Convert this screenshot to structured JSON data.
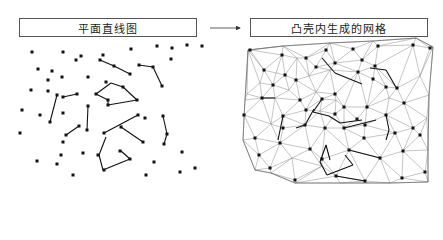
{
  "left_panel": {
    "title": "平面直线图",
    "points": [
      [
        32,
        52
      ],
      [
        63,
        52
      ],
      [
        76,
        60
      ],
      [
        81,
        56
      ],
      [
        103,
        55
      ],
      [
        131,
        49
      ],
      [
        157,
        46
      ],
      [
        187,
        45
      ],
      [
        202,
        46
      ],
      [
        100,
        60
      ],
      [
        114,
        66
      ],
      [
        130,
        74
      ],
      [
        139,
        65
      ],
      [
        153,
        67
      ],
      [
        162,
        86
      ],
      [
        171,
        59
      ],
      [
        172,
        48
      ],
      [
        38,
        69
      ],
      [
        52,
        71
      ],
      [
        62,
        77
      ],
      [
        48,
        80
      ],
      [
        88,
        77
      ],
      [
        63,
        97
      ],
      [
        77,
        94
      ],
      [
        31,
        90
      ],
      [
        48,
        91
      ],
      [
        57,
        95
      ],
      [
        106,
        82
      ],
      [
        123,
        87
      ],
      [
        96,
        94
      ],
      [
        108,
        100
      ],
      [
        108,
        105
      ],
      [
        137,
        100
      ],
      [
        22,
        110
      ],
      [
        40,
        115
      ],
      [
        63,
        113
      ],
      [
        88,
        106
      ],
      [
        138,
        115
      ],
      [
        145,
        118
      ],
      [
        163,
        116
      ],
      [
        50,
        122
      ],
      [
        79,
        126
      ],
      [
        66,
        135
      ],
      [
        87,
        130
      ],
      [
        20,
        133
      ],
      [
        104,
        133
      ],
      [
        121,
        127
      ],
      [
        143,
        142
      ],
      [
        167,
        134
      ],
      [
        164,
        144
      ],
      [
        63,
        142
      ],
      [
        83,
        153
      ],
      [
        61,
        155
      ],
      [
        98,
        155
      ],
      [
        120,
        151
      ],
      [
        130,
        159
      ],
      [
        37,
        161
      ],
      [
        57,
        164
      ],
      [
        73,
        175
      ],
      [
        104,
        170
      ],
      [
        154,
        162
      ],
      [
        146,
        175
      ],
      [
        182,
        152
      ],
      [
        195,
        168
      ],
      [
        180,
        172
      ]
    ],
    "segments": [
      [
        [
          100,
          60
        ],
        [
          114,
          66
        ]
      ],
      [
        [
          114,
          66
        ],
        [
          130,
          74
        ]
      ],
      [
        [
          139,
          65
        ],
        [
          153,
          67
        ]
      ],
      [
        [
          153,
          67
        ],
        [
          162,
          86
        ]
      ],
      [
        [
          63,
          97
        ],
        [
          77,
          94
        ]
      ],
      [
        [
          111,
          83
        ],
        [
          96,
          94
        ]
      ],
      [
        [
          111,
          83
        ],
        [
          123,
          87
        ]
      ],
      [
        [
          123,
          87
        ],
        [
          137,
          100
        ]
      ],
      [
        [
          96,
          94
        ],
        [
          108,
          100
        ]
      ],
      [
        [
          108,
          100
        ],
        [
          108,
          105
        ]
      ],
      [
        [
          108,
          105
        ],
        [
          137,
          100
        ]
      ],
      [
        [
          57,
          95
        ],
        [
          50,
          122
        ]
      ],
      [
        [
          88,
          106
        ],
        [
          87,
          130
        ]
      ],
      [
        [
          66,
          135
        ],
        [
          79,
          126
        ]
      ],
      [
        [
          104,
          133
        ],
        [
          138,
          115
        ]
      ],
      [
        [
          121,
          127
        ],
        [
          143,
          142
        ]
      ],
      [
        [
          163,
          116
        ],
        [
          167,
          134
        ]
      ],
      [
        [
          167,
          134
        ],
        [
          164,
          144
        ]
      ],
      [
        [
          106,
          137
        ],
        [
          99,
          155
        ]
      ],
      [
        [
          99,
          155
        ],
        [
          103,
          170
        ]
      ],
      [
        [
          103,
          170
        ],
        [
          130,
          159
        ]
      ],
      [
        [
          130,
          159
        ],
        [
          121,
          151
        ]
      ]
    ]
  },
  "arrow": {
    "x1": 210,
    "y1": 28,
    "x2": 240,
    "y2": 28
  },
  "right_panel": {
    "title": "凸壳内生成的网格",
    "hull": [
      [
        248,
        50
      ],
      [
        283,
        46
      ],
      [
        330,
        43
      ],
      [
        373,
        41
      ],
      [
        416,
        38
      ],
      [
        433,
        47
      ],
      [
        429,
        95
      ],
      [
        428,
        150
      ],
      [
        428,
        182
      ],
      [
        390,
        183
      ],
      [
        340,
        183
      ],
      [
        295,
        183
      ],
      [
        271,
        173
      ],
      [
        255,
        170
      ],
      [
        243,
        140
      ],
      [
        245,
        100
      ]
    ],
    "points": [
      [
        250,
        50
      ],
      [
        282,
        55
      ],
      [
        297,
        58
      ],
      [
        306,
        58
      ],
      [
        326,
        50
      ],
      [
        353,
        49
      ],
      [
        378,
        46
      ],
      [
        413,
        45
      ],
      [
        430,
        48
      ],
      [
        264,
        70
      ],
      [
        276,
        73
      ],
      [
        285,
        75
      ],
      [
        309,
        76
      ],
      [
        316,
        67
      ],
      [
        330,
        70
      ],
      [
        335,
        63
      ],
      [
        362,
        60
      ],
      [
        375,
        66
      ],
      [
        260,
        83
      ],
      [
        273,
        85
      ],
      [
        289,
        90
      ],
      [
        296,
        80
      ],
      [
        316,
        92
      ],
      [
        335,
        94
      ],
      [
        358,
        72
      ],
      [
        373,
        79
      ],
      [
        386,
        87
      ],
      [
        389,
        98
      ],
      [
        247,
        94
      ],
      [
        262,
        98
      ],
      [
        275,
        98
      ],
      [
        300,
        100
      ],
      [
        322,
        99
      ],
      [
        336,
        100
      ],
      [
        344,
        107
      ],
      [
        367,
        107
      ],
      [
        397,
        88
      ],
      [
        244,
        115
      ],
      [
        271,
        124
      ],
      [
        283,
        116
      ],
      [
        306,
        110
      ],
      [
        320,
        111
      ],
      [
        335,
        114
      ],
      [
        357,
        119
      ],
      [
        386,
        115
      ],
      [
        404,
        103
      ],
      [
        420,
        76
      ],
      [
        255,
        138
      ],
      [
        283,
        128
      ],
      [
        305,
        125
      ],
      [
        325,
        128
      ],
      [
        344,
        128
      ],
      [
        365,
        125
      ],
      [
        395,
        133
      ],
      [
        413,
        128
      ],
      [
        427,
        118
      ],
      [
        259,
        155
      ],
      [
        280,
        143
      ],
      [
        292,
        158
      ],
      [
        310,
        149
      ],
      [
        322,
        159
      ],
      [
        349,
        150
      ],
      [
        364,
        138
      ],
      [
        380,
        158
      ],
      [
        403,
        151
      ],
      [
        420,
        135
      ],
      [
        270,
        168
      ],
      [
        295,
        180
      ],
      [
        322,
        166
      ],
      [
        336,
        176
      ],
      [
        365,
        181
      ],
      [
        402,
        178
      ],
      [
        425,
        172
      ]
    ],
    "markers": [
      [
        250,
        50
      ],
      [
        282,
        55
      ],
      [
        306,
        58
      ],
      [
        326,
        50
      ],
      [
        353,
        49
      ],
      [
        378,
        46
      ],
      [
        413,
        45
      ],
      [
        430,
        48
      ],
      [
        264,
        70
      ],
      [
        285,
        75
      ],
      [
        316,
        67
      ],
      [
        335,
        63
      ],
      [
        362,
        60
      ],
      [
        375,
        66
      ],
      [
        273,
        85
      ],
      [
        296,
        80
      ],
      [
        335,
        94
      ],
      [
        358,
        72
      ],
      [
        373,
        79
      ],
      [
        386,
        87
      ],
      [
        397,
        88
      ],
      [
        262,
        98
      ],
      [
        300,
        100
      ],
      [
        322,
        99
      ],
      [
        344,
        107
      ],
      [
        367,
        107
      ],
      [
        404,
        103
      ],
      [
        283,
        116
      ],
      [
        306,
        110
      ],
      [
        335,
        114
      ],
      [
        357,
        119
      ],
      [
        386,
        115
      ],
      [
        255,
        138
      ],
      [
        283,
        128
      ],
      [
        305,
        125
      ],
      [
        325,
        128
      ],
      [
        344,
        128
      ],
      [
        365,
        125
      ],
      [
        395,
        133
      ],
      [
        413,
        128
      ],
      [
        259,
        155
      ],
      [
        280,
        143
      ],
      [
        310,
        149
      ],
      [
        322,
        159
      ],
      [
        349,
        150
      ],
      [
        364,
        138
      ],
      [
        380,
        158
      ],
      [
        403,
        151
      ],
      [
        420,
        135
      ],
      [
        270,
        168
      ],
      [
        295,
        180
      ],
      [
        336,
        176
      ],
      [
        365,
        181
      ],
      [
        402,
        178
      ],
      [
        425,
        172
      ],
      [
        244,
        115
      ]
    ],
    "segments": [
      [
        [
          322,
          58
        ],
        [
          335,
          73
        ]
      ],
      [
        [
          335,
          73
        ],
        [
          362,
          84
        ]
      ],
      [
        [
          370,
          68
        ],
        [
          386,
          70
        ]
      ],
      [
        [
          386,
          70
        ],
        [
          397,
          89
        ]
      ],
      [
        [
          296,
          128
        ],
        [
          305,
          125
        ]
      ],
      [
        [
          305,
          125
        ],
        [
          314,
          109
        ]
      ],
      [
        [
          275,
          98
        ],
        [
          262,
          98
        ]
      ],
      [
        [
          283,
          116
        ],
        [
          278,
          140
        ]
      ],
      [
        [
          322,
          99
        ],
        [
          313,
          112
        ]
      ],
      [
        [
          313,
          112
        ],
        [
          329,
          116
        ]
      ],
      [
        [
          329,
          116
        ],
        [
          340,
          123
        ]
      ],
      [
        [
          340,
          123
        ],
        [
          362,
          120
        ]
      ],
      [
        [
          326,
          145
        ],
        [
          330,
          160
        ]
      ],
      [
        [
          336,
          176
        ],
        [
          365,
          181
        ]
      ],
      [
        [
          344,
          128
        ],
        [
          376,
          120
        ]
      ],
      [
        [
          349,
          150
        ],
        [
          380,
          158
        ]
      ],
      [
        [
          386,
          115
        ],
        [
          389,
          130
        ]
      ],
      [
        [
          389,
          130
        ],
        [
          386,
          140
        ]
      ],
      [
        [
          326,
          145
        ],
        [
          320,
          162
        ]
      ],
      [
        [
          320,
          162
        ],
        [
          327,
          175
        ]
      ],
      [
        [
          327,
          175
        ],
        [
          353,
          165
        ]
      ],
      [
        [
          353,
          165
        ],
        [
          345,
          155
        ]
      ]
    ]
  }
}
